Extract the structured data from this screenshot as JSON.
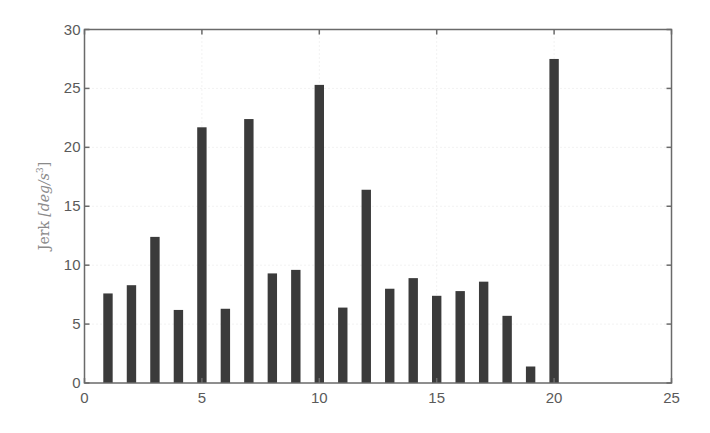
{
  "chart_data": {
    "type": "bar",
    "title": "",
    "xlabel": "",
    "ylabel": "Jerk [deg/s³]",
    "ylabel_parts": {
      "prefix": "Jerk ",
      "unit": "[deg/s",
      "exp": "3",
      "close": "]"
    },
    "x": [
      1,
      2,
      3,
      4,
      5,
      6,
      7,
      8,
      9,
      10,
      11,
      12,
      13,
      14,
      15,
      16,
      17,
      18,
      19,
      20
    ],
    "values": [
      7.6,
      8.3,
      12.4,
      6.2,
      21.7,
      6.3,
      22.4,
      9.3,
      9.6,
      25.3,
      6.4,
      16.4,
      8.0,
      8.9,
      7.4,
      7.8,
      8.6,
      5.7,
      1.4,
      27.5
    ],
    "xlim": [
      0,
      25
    ],
    "ylim": [
      0,
      30
    ],
    "xticks": [
      0,
      5,
      10,
      15,
      20,
      25
    ],
    "yticks": [
      0,
      5,
      10,
      15,
      20,
      25,
      30
    ],
    "xtick_labels": [
      "0",
      "5",
      "10",
      "15",
      "20",
      "25"
    ],
    "ytick_labels": [
      "0",
      "5",
      "10",
      "15",
      "20",
      "25",
      "30"
    ],
    "grid": true,
    "legend": null,
    "bar_color": "#3b3b3b",
    "bar_width": 0.4
  }
}
